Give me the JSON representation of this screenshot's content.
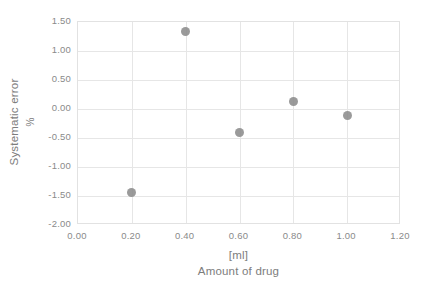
{
  "chart_data": {
    "type": "scatter",
    "title": "",
    "xlabel": "Amount of drug",
    "xlabel_unit": "[ml]",
    "ylabel": "Systematic error",
    "ylabel_unit": "%",
    "xlim": [
      0.0,
      1.2
    ],
    "ylim": [
      -2.0,
      1.5
    ],
    "xticks": [
      "0.00",
      "0.20",
      "0.40",
      "0.60",
      "0.80",
      "1.00",
      "1.20"
    ],
    "xtick_values": [
      0.0,
      0.2,
      0.4,
      0.6,
      0.8,
      1.0,
      1.2
    ],
    "yticks": [
      "1.50",
      "1.00",
      "0.50",
      "0.00",
      "-0.50",
      "-1.00",
      "-1.50",
      "-2.00"
    ],
    "ytick_values": [
      1.5,
      1.0,
      0.5,
      0.0,
      -0.5,
      -1.0,
      -1.5,
      -2.0
    ],
    "grid": true,
    "legend": false,
    "marker_color": "#8c8c8c",
    "gridline_color": "#e6e6e6",
    "text_color": "#8a8a8a",
    "background": "#ffffff",
    "x": [
      0.2,
      0.4,
      0.6,
      0.8,
      1.0
    ],
    "values": [
      -1.44,
      1.34,
      -0.4,
      0.13,
      -0.11
    ],
    "points": [
      {
        "x": 0.2,
        "y": -1.44
      },
      {
        "x": 0.4,
        "y": 1.34
      },
      {
        "x": 0.6,
        "y": -0.4
      },
      {
        "x": 0.8,
        "y": 0.13
      },
      {
        "x": 1.0,
        "y": -0.11
      }
    ]
  }
}
